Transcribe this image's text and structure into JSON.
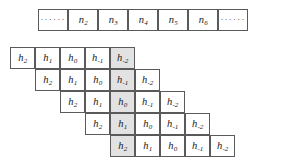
{
  "figure": {
    "kind": "convolution-toeplitz-staircase",
    "ellipsis_glyph": "······",
    "colors": {
      "border": "#5a5a5a",
      "cell_background": "#ffffff",
      "shaded_background": "#e2e2e2",
      "text": "#1a1a1a",
      "page_background": "#ffffff"
    }
  },
  "input_row": {
    "label": "input-sequence-row",
    "cells": [
      {
        "type": "ellipsis",
        "text": "······",
        "shaded": false
      },
      {
        "type": "symbol",
        "base": "n",
        "subscript": "2",
        "shaded": false
      },
      {
        "type": "symbol",
        "base": "n",
        "subscript": "3",
        "shaded": false
      },
      {
        "type": "symbol",
        "base": "n",
        "subscript": "4",
        "shaded": false
      },
      {
        "type": "symbol",
        "base": "n",
        "subscript": "5",
        "shaded": false
      },
      {
        "type": "symbol",
        "base": "n",
        "subscript": "6",
        "shaded": false
      },
      {
        "type": "ellipsis",
        "text": "······",
        "shaded": false
      }
    ]
  },
  "filter_rows": [
    {
      "label": "filter-row-1",
      "offset_cells": 0,
      "cells": [
        {
          "type": "symbol",
          "base": "h",
          "subscript": "2",
          "shaded": false
        },
        {
          "type": "symbol",
          "base": "h",
          "subscript": "1",
          "shaded": false
        },
        {
          "type": "symbol",
          "base": "h",
          "subscript": "0",
          "shaded": false
        },
        {
          "type": "symbol",
          "base": "h",
          "subscript": "-1",
          "shaded": false
        },
        {
          "type": "symbol",
          "base": "h",
          "subscript": "-2",
          "shaded": true
        }
      ]
    },
    {
      "label": "filter-row-2",
      "offset_cells": 1,
      "cells": [
        {
          "type": "symbol",
          "base": "h",
          "subscript": "2",
          "shaded": false
        },
        {
          "type": "symbol",
          "base": "h",
          "subscript": "1",
          "shaded": false
        },
        {
          "type": "symbol",
          "base": "h",
          "subscript": "0",
          "shaded": false
        },
        {
          "type": "symbol",
          "base": "h",
          "subscript": "-1",
          "shaded": true
        },
        {
          "type": "symbol",
          "base": "h",
          "subscript": "-2",
          "shaded": false
        }
      ]
    },
    {
      "label": "filter-row-3",
      "offset_cells": 2,
      "cells": [
        {
          "type": "symbol",
          "base": "h",
          "subscript": "2",
          "shaded": false
        },
        {
          "type": "symbol",
          "base": "h",
          "subscript": "1",
          "shaded": false
        },
        {
          "type": "symbol",
          "base": "h",
          "subscript": "0",
          "shaded": true
        },
        {
          "type": "symbol",
          "base": "h",
          "subscript": "-1",
          "shaded": false
        },
        {
          "type": "symbol",
          "base": "h",
          "subscript": "-2",
          "shaded": false
        }
      ]
    },
    {
      "label": "filter-row-4",
      "offset_cells": 3,
      "cells": [
        {
          "type": "symbol",
          "base": "h",
          "subscript": "2",
          "shaded": false
        },
        {
          "type": "symbol",
          "base": "h",
          "subscript": "1",
          "shaded": true
        },
        {
          "type": "symbol",
          "base": "h",
          "subscript": "0",
          "shaded": false
        },
        {
          "type": "symbol",
          "base": "h",
          "subscript": "-1",
          "shaded": false
        },
        {
          "type": "symbol",
          "base": "h",
          "subscript": "-2",
          "shaded": false
        }
      ]
    },
    {
      "label": "filter-row-5",
      "offset_cells": 4,
      "cells": [
        {
          "type": "symbol",
          "base": "h",
          "subscript": "2",
          "shaded": true
        },
        {
          "type": "symbol",
          "base": "h",
          "subscript": "1",
          "shaded": false
        },
        {
          "type": "symbol",
          "base": "h",
          "subscript": "0",
          "shaded": false
        },
        {
          "type": "symbol",
          "base": "h",
          "subscript": "-1",
          "shaded": false
        },
        {
          "type": "symbol",
          "base": "h",
          "subscript": "-2",
          "shaded": false
        }
      ]
    }
  ],
  "geometry": {
    "input_row": {
      "left": 38,
      "top": 9,
      "cell_width": 30,
      "cell_height": 22
    },
    "filter_grid": {
      "left": 10,
      "top": 47,
      "cell_width": 25,
      "cell_height": 22,
      "row_step": 22
    }
  }
}
